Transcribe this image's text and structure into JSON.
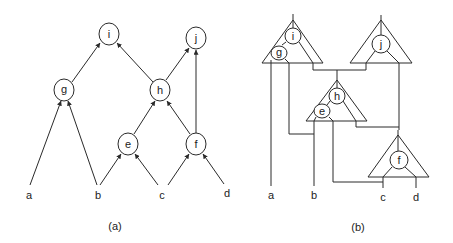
{
  "figure_a": {
    "caption": "(a)",
    "nodes": {
      "i": "i",
      "j": "j",
      "g": "g",
      "h": "h",
      "e": "e",
      "f": "f"
    },
    "leaves": {
      "a": "a",
      "b": "b",
      "c": "c",
      "d": "d"
    },
    "edges": [
      [
        "a",
        "g"
      ],
      [
        "b",
        "g"
      ],
      [
        "b",
        "e"
      ],
      [
        "c",
        "e"
      ],
      [
        "c",
        "f"
      ],
      [
        "d",
        "f"
      ],
      [
        "e",
        "h"
      ],
      [
        "f",
        "h"
      ],
      [
        "f",
        "j"
      ],
      [
        "g",
        "i"
      ],
      [
        "h",
        "i"
      ],
      [
        "h",
        "j"
      ]
    ]
  },
  "figure_b": {
    "caption": "(b)",
    "subtrees": [
      {
        "nodes": [
          "i",
          "g"
        ]
      },
      {
        "nodes": [
          "j"
        ]
      },
      {
        "nodes": [
          "h",
          "e"
        ]
      },
      {
        "nodes": [
          "f"
        ]
      }
    ],
    "nodes": {
      "i": "i",
      "g": "g",
      "j": "j",
      "h": "h",
      "e": "e",
      "f": "f"
    },
    "leaves": {
      "a": "a",
      "b": "b",
      "c": "c",
      "d": "d"
    }
  },
  "colors": {
    "stroke": "#2a2a2a",
    "text": "#222222",
    "background": "#ffffff"
  }
}
